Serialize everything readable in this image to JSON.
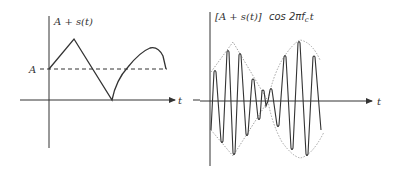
{
  "left_plot": {
    "y_label": "A + s(t)",
    "level_label": "A",
    "x_label": "t",
    "description": "Message signal offset by DC level A: triangle rise then fall to zero, then rising arc back down to level A"
  },
  "right_plot": {
    "y_label_prefix": "[A + s(t)]",
    "y_label_suffix": "cos 2πf",
    "y_label_sub": "c",
    "y_label_tail": "t",
    "x_label": "t",
    "description": "AM waveform: carrier cos 2πf_c t modulated by envelope A + s(t), dotted envelope shown"
  },
  "colors": {
    "stroke": "#333333",
    "envelope": "#999999",
    "background": "#ffffff"
  }
}
